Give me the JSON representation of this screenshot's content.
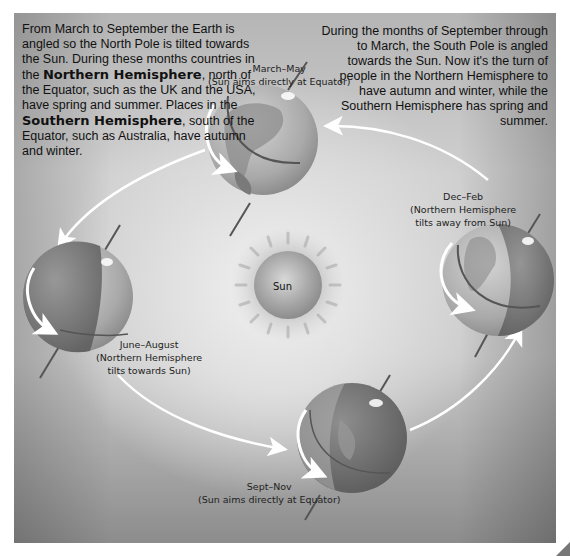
{
  "intro_left": {
    "line1": "From March to September the Earth is angled so the North Pole is tilted towards the Sun. During these months countries in the",
    "bold1": "Northern Hemisphere",
    "line2": ", north of the Equator, such as the UK and the USA, have spring and summer. Places in the",
    "bold2": "Southern Hemisphere",
    "line3": ", south of the Equator, such as Australia, have autumn and winter."
  },
  "intro_right": {
    "text": "During the months of September through to March, the South Pole is angled towards the Sun. Now it's the turn of people in the Northern Hemisphere to have autumn and winter, while the Southern Hemisphere has spring and summer."
  },
  "sun": {
    "label": "Sun"
  },
  "seasons": [
    {
      "id": "march-may",
      "title": "March–May",
      "subtitle": "(Sun aims directly at Equator)"
    },
    {
      "id": "june-august",
      "title": "June–August",
      "subtitle_line1": "(Northern Hemisphere",
      "subtitle_line2": "tilts towards Sun)"
    },
    {
      "id": "sept-nov",
      "title": "Sept–Nov",
      "subtitle": "(Sun aims directly at Equator)"
    },
    {
      "id": "dec-feb",
      "title": "Dec–Feb",
      "subtitle_line1": "(Northern Hemisphere",
      "subtitle_line2": "tilts away from Sun)"
    }
  ],
  "colors": {
    "background_light": "#e6e6e6",
    "background_dark": "#8c8c8c",
    "globe_ocean": "#9a9a9a",
    "globe_shadow": "#6e6e6e",
    "arrow": "#ffffff",
    "text": "#111111"
  }
}
